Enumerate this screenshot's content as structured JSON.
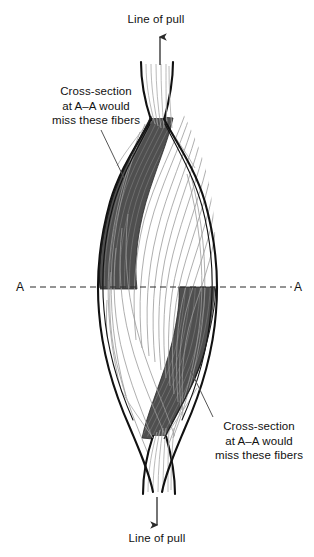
{
  "figure": {
    "background_color": "#ffffff",
    "outline_color": "#111111",
    "fiber_line_color": "#8f8f8f",
    "shaded_fiber_color": "#4f4f4f",
    "shaded_fiber_color_light": "#606060",
    "text_color": "#111111"
  },
  "labels": {
    "top_pull": "Line of pull",
    "bottom_pull": "Line of pull",
    "top_callout": {
      "line1": "Cross-section",
      "line2": "at A–A would",
      "line3": "miss these fibers"
    },
    "bottom_callout": {
      "line1": "Cross-section",
      "line2": "at A–A would",
      "line3": "miss these fibers"
    },
    "section_left": "A",
    "section_right": "A"
  },
  "annotations": {
    "section_line_style": "dashed",
    "section_line_y": 287,
    "top_arrow_direction": "up",
    "bottom_arrow_direction": "down",
    "shaded_region_count": 2,
    "shaded_region_top_position": "upper-left",
    "shaded_region_bottom_position": "lower-right"
  }
}
